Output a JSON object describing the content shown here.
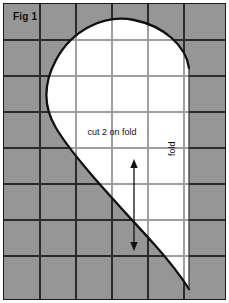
{
  "figure": {
    "label": "Fig 1",
    "cut_instruction": "cut 2 on fold",
    "fold_label": "fold",
    "colors": {
      "grid_background": "#969696",
      "pattern_fill": "#ffffff",
      "grid_line": "#2b2b2b",
      "outline": "#111111",
      "border": "#1b1b1b",
      "page": "#ffffff"
    },
    "grid": {
      "columns": 6,
      "rows": 8,
      "cell_width": 36,
      "cell_height": 36,
      "x_lines": [
        36,
        72,
        108,
        144,
        180
      ],
      "y_lines": [
        36,
        72,
        108,
        144,
        180,
        216,
        252
      ],
      "grid_visible": true
    },
    "pattern": {
      "shape": "half-heart on fold",
      "fold_line_x": 185,
      "apex": {
        "x": 115,
        "y": 16
      },
      "leftmost": {
        "x": 45,
        "y": 107
      },
      "fold_top_end": {
        "x": 185,
        "y": 64
      },
      "fold_bottom_end": {
        "x": 185,
        "y": 285
      }
    },
    "grain_arrow": {
      "orientation": "vertical",
      "double_headed": true,
      "x": 130,
      "y_top": 158,
      "y_bottom": 244
    }
  }
}
